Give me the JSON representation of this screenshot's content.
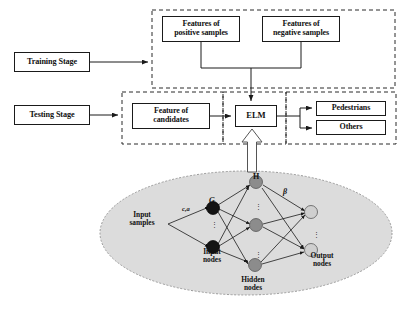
{
  "figure": {
    "background_color": "#ffffff",
    "line_color": "#1a1a1a"
  },
  "pipeline": {
    "stages": [
      {
        "id": "training-stage",
        "label": "Training Stage"
      },
      {
        "id": "testing-stage",
        "label": "Testing Stage"
      }
    ],
    "training_inputs": [
      {
        "id": "positive-features",
        "line1": "Features of",
        "line2": "positive samples"
      },
      {
        "id": "negative-features",
        "line1": "Features of",
        "line2": "negative samples"
      }
    ],
    "testing_input": {
      "id": "candidate-features",
      "line1": "Feature of",
      "line2": "candidates"
    },
    "classifier": {
      "id": "elm",
      "label": "ELM"
    },
    "outputs": [
      {
        "id": "pedestrians",
        "label": "Pedestrians"
      },
      {
        "id": "others",
        "label": "Others"
      }
    ]
  },
  "network": {
    "region_label": "ELM network detail",
    "fill_color": "#d9d9d9",
    "layers": [
      {
        "id": "input-samples",
        "line1": "Input",
        "line2": "samples"
      },
      {
        "id": "input-nodes",
        "line1": "Input",
        "line2": "nodes"
      },
      {
        "id": "hidden-nodes",
        "line1": "Hidden",
        "line2": "nodes"
      },
      {
        "id": "output-nodes",
        "line1": "Output",
        "line2": "nodes"
      }
    ],
    "symbols": [
      {
        "id": "activation-G",
        "text": "G"
      },
      {
        "id": "hidden-output-matrix-H",
        "text": "H"
      },
      {
        "id": "output-weight-beta",
        "text": "β"
      },
      {
        "id": "input-weight-ca",
        "text": "c,a"
      }
    ],
    "ellipsis": "⋮",
    "node_colors": {
      "input_node": "#111111",
      "hidden_node": "#8c8c8c",
      "output_node": "#c9c9c9"
    },
    "counts": {
      "input_nodes": 2,
      "hidden_nodes": 3,
      "output_nodes": 2
    }
  }
}
